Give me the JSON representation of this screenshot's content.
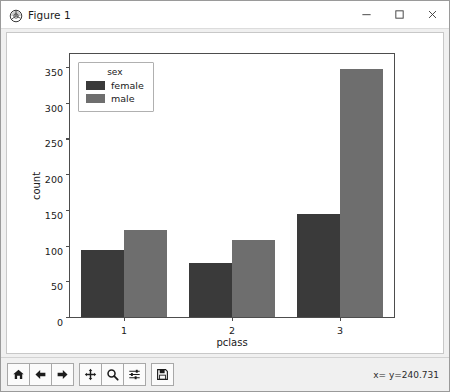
{
  "window": {
    "title": "Figure 1",
    "app_icon": "matplotlib-icon",
    "controls": {
      "minimize": "minimize-icon",
      "maximize": "maximize-icon",
      "close": "close-icon"
    }
  },
  "chart_data": {
    "type": "bar",
    "title": "",
    "xlabel": "pclass",
    "ylabel": "count",
    "categories": [
      "1",
      "2",
      "3"
    ],
    "series": [
      {
        "name": "female",
        "values": [
          94,
          76,
          144
        ],
        "color": "#3a3a3a"
      },
      {
        "name": "male",
        "values": [
          122,
          108,
          347
        ],
        "color": "#6e6e6e"
      }
    ],
    "legend": {
      "title": "sex",
      "position": "upper left"
    },
    "ylim": [
      0,
      368
    ],
    "yticks": [
      0,
      50,
      100,
      150,
      200,
      250,
      300,
      350
    ],
    "grid": false
  },
  "toolbar": {
    "buttons": [
      {
        "name": "home-button",
        "icon": "home-icon",
        "tooltip": "Reset original view"
      },
      {
        "name": "back-button",
        "icon": "arrow-left-icon",
        "tooltip": "Back to previous view"
      },
      {
        "name": "forward-button",
        "icon": "arrow-right-icon",
        "tooltip": "Forward to next view"
      },
      {
        "name": "pan-button",
        "icon": "move-icon",
        "tooltip": "Pan axes with left mouse"
      },
      {
        "name": "zoom-button",
        "icon": "magnifier-icon",
        "tooltip": "Zoom to rectangle"
      },
      {
        "name": "configure-subplots-button",
        "icon": "sliders-icon",
        "tooltip": "Configure subplots"
      },
      {
        "name": "save-button",
        "icon": "floppy-disk-icon",
        "tooltip": "Save the figure"
      }
    ],
    "status": "x= y=240.731"
  }
}
